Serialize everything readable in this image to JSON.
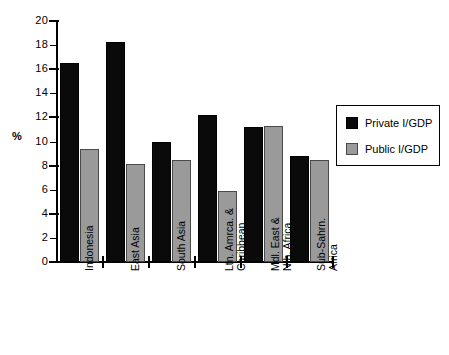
{
  "chart_data": {
    "type": "bar",
    "title": "",
    "xlabel": "",
    "ylabel": "%",
    "ylim": [
      0,
      20
    ],
    "ytick_step": 2,
    "yticks": [
      0,
      2,
      4,
      6,
      8,
      10,
      12,
      14,
      16,
      18,
      20
    ],
    "grid": false,
    "legend_position": "right",
    "categories": [
      "Indonesia",
      "East Asia",
      "South Asia",
      "Ltn. Amrca. &\nCaribbean",
      "Mdl. East &\nNth. Africa",
      "Sub-Sahrn.\nAfrica"
    ],
    "series": [
      {
        "name": "Private I/GDP",
        "color": "#0a0a0a",
        "values": [
          16.5,
          18.3,
          10.0,
          12.2,
          11.2,
          8.8
        ]
      },
      {
        "name": "Public I/GDP",
        "color": "#9a9a9a",
        "values": [
          9.4,
          8.1,
          8.5,
          5.9,
          11.3,
          8.5
        ]
      }
    ]
  },
  "legend": {
    "entries": [
      {
        "label": "Private I/GDP",
        "swatch": "black-square"
      },
      {
        "label": "Public I/GDP",
        "swatch": "gray-square"
      }
    ]
  },
  "axis": {
    "y_title": "%"
  }
}
